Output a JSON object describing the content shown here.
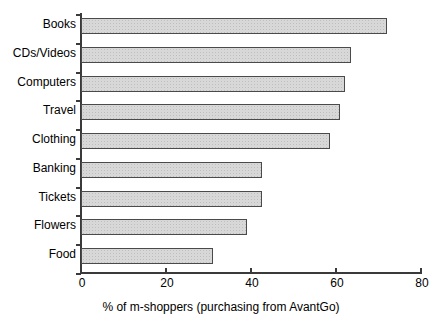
{
  "chart_data": {
    "type": "bar",
    "orientation": "horizontal",
    "title": "",
    "subtitle": "",
    "xlabel": "% of m-shoppers (purchasing from AvantGo)",
    "ylabel": "",
    "xlim": [
      0,
      80
    ],
    "xticks": [
      0,
      20,
      40,
      60,
      80
    ],
    "xtick_labels": [
      "0",
      "20",
      "40",
      "60",
      "80"
    ],
    "grid": false,
    "legend": null,
    "categories": [
      "Books",
      "CDs/Videos",
      "Computers",
      "Travel",
      "Clothing",
      "Banking",
      "Tickets",
      "Flowers",
      "Food"
    ],
    "values": [
      72,
      63.5,
      62,
      61,
      58.5,
      42.5,
      42.5,
      39,
      31
    ],
    "series": [
      {
        "name": "% of m-shoppers",
        "values": [
          72,
          63.5,
          62,
          61,
          58.5,
          42.5,
          42.5,
          39,
          31
        ]
      }
    ],
    "bar_fill_color": "#d9d9d9",
    "bar_border_color": "#4a4a4a",
    "axis_color": "#3a3a3a"
  }
}
